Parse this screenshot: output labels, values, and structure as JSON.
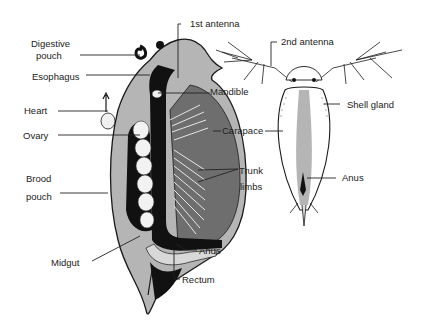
{
  "diagram": {
    "views": [
      {
        "id": "lateral",
        "description": "Lateral internal view"
      },
      {
        "id": "dorsal",
        "description": "Dorsal external view"
      }
    ],
    "colors": {
      "ink": "#1a1a1a",
      "shell_gray": "#b5b5b5",
      "dark_gray": "#6e6e6e",
      "light": "#e8e8e8",
      "background": "#ffffff"
    },
    "labels": {
      "first_antenna": "1st antenna",
      "digestive_pouch_1": "Digestive",
      "digestive_pouch_2": "pouch",
      "esophagus": "Esophagus",
      "heart": "Heart",
      "ovary": "Ovary",
      "brood_pouch_1": "Brood",
      "brood_pouch_2": "pouch",
      "midgut": "Midgut",
      "mandible": "Mandible",
      "carapace": "Carapace",
      "trunk_limbs_1": "Trunk",
      "trunk_limbs_2": "limbs",
      "anus_lateral": "Anus",
      "rectum": "Rectum",
      "second_antenna": "2nd antenna",
      "shell_gland": "Shell gland",
      "anus_dorsal": "Anus"
    }
  }
}
